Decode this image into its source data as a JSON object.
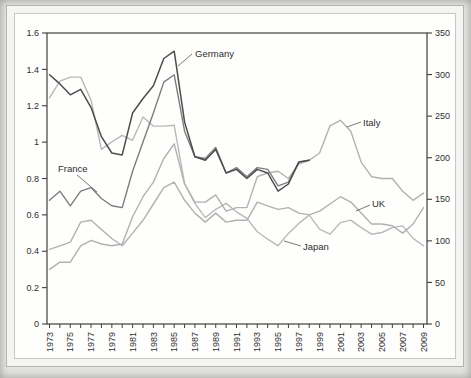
{
  "figure": {
    "page_background": "#e3e4e0",
    "frame_color": "#b4b5b1",
    "panel_background": "#fefefd",
    "axis_color": "#3f3f3f",
    "text_color": "#2e2e2e"
  },
  "chart_data": {
    "type": "line",
    "title": "",
    "xlabel": "",
    "ylabel_left": "",
    "ylabel_right": "",
    "grid": false,
    "legend_position": "none",
    "y_left": {
      "min": 0,
      "max": 1.6,
      "tick_labels": [
        "0",
        "0.2",
        "0.4",
        "0.6",
        "0.8",
        "1",
        "1.2",
        "1.4",
        "1.6"
      ]
    },
    "y_right": {
      "min": 0,
      "max": 350,
      "tick_labels": [
        "0",
        "50",
        "100",
        "150",
        "200",
        "250",
        "300",
        "350"
      ]
    },
    "x": [
      1973,
      1974,
      1975,
      1976,
      1977,
      1978,
      1979,
      1980,
      1981,
      1982,
      1983,
      1984,
      1985,
      1986,
      1987,
      1988,
      1989,
      1990,
      1991,
      1992,
      1993,
      1994,
      1995,
      1996,
      1997,
      1998,
      1999,
      2000,
      2001,
      2002,
      2003,
      2004,
      2005,
      2006,
      2007,
      2008,
      2009
    ],
    "x_tick_labels": [
      "1973",
      "1975",
      "1977",
      "1979",
      "1981",
      "1983",
      "1985",
      "1987",
      "1989",
      "1991",
      "1993",
      "1995",
      "1997",
      "1999",
      "2001",
      "2003",
      "2005",
      "2007",
      "2009"
    ],
    "series": [
      {
        "name": "Germany",
        "axis": "left",
        "color": "#4d4d4d",
        "width": 1.5,
        "values": [
          1.37,
          1.32,
          1.26,
          1.29,
          1.19,
          1.03,
          0.94,
          0.93,
          1.16,
          1.24,
          1.31,
          1.46,
          1.5,
          1.11,
          0.92,
          0.9,
          0.96,
          0.83,
          0.85,
          0.8,
          0.85,
          0.83,
          0.73,
          0.77,
          0.89,
          0.9,
          null,
          null,
          null,
          null,
          null,
          null,
          null,
          null,
          null,
          null,
          null
        ]
      },
      {
        "name": "France",
        "axis": "left",
        "color": "#7d7d7d",
        "width": 1.4,
        "values": [
          0.68,
          0.73,
          0.65,
          0.73,
          0.75,
          0.69,
          0.65,
          0.64,
          0.84,
          1.0,
          1.16,
          1.33,
          1.37,
          1.06,
          0.92,
          0.91,
          0.97,
          0.83,
          0.86,
          0.81,
          0.86,
          0.85,
          0.76,
          0.78,
          0.89,
          0.9,
          null,
          null,
          null,
          null,
          null,
          null,
          null,
          null,
          null,
          null,
          null
        ]
      },
      {
        "name": "Italy",
        "axis": "left",
        "color": "#b1b1b1",
        "width": 1.4,
        "values": [
          0.3,
          0.34,
          0.34,
          0.43,
          0.46,
          0.44,
          0.43,
          0.44,
          0.59,
          0.7,
          0.78,
          0.91,
          0.99,
          0.77,
          0.67,
          0.67,
          0.71,
          0.62,
          0.64,
          0.64,
          0.81,
          0.83,
          0.84,
          0.8,
          0.88,
          0.9,
          0.94,
          1.09,
          1.12,
          1.06,
          0.89,
          0.81,
          0.8,
          0.8,
          0.73,
          0.68,
          0.72
        ]
      },
      {
        "name": "UK",
        "axis": "left",
        "color": "#b1b1b1",
        "width": 1.4,
        "values": [
          0.41,
          0.43,
          0.45,
          0.56,
          0.57,
          0.52,
          0.47,
          0.43,
          0.5,
          0.57,
          0.66,
          0.75,
          0.78,
          0.68,
          0.61,
          0.56,
          0.61,
          0.56,
          0.57,
          0.57,
          0.67,
          0.65,
          0.63,
          0.64,
          0.61,
          0.6,
          0.62,
          0.66,
          0.7,
          0.67,
          0.61,
          0.55,
          0.55,
          0.54,
          0.5,
          0.55,
          0.64
        ]
      },
      {
        "name": "Japan",
        "axis": "right",
        "color": "#b9b9b9",
        "width": 1.4,
        "values": [
          272,
          292,
          297,
          297,
          269,
          210,
          219,
          227,
          221,
          249,
          238,
          238,
          239,
          169,
          145,
          128,
          138,
          145,
          135,
          127,
          111,
          102,
          94,
          109,
          121,
          131,
          114,
          108,
          122,
          125,
          116,
          108,
          110,
          116,
          118,
          103,
          94
        ]
      }
    ],
    "annotations": [
      {
        "text": "Germany",
        "x": 195,
        "y": 57,
        "ax1": 192,
        "ay1": 54,
        "ax2": 178,
        "ay2": 66
      },
      {
        "text": "France",
        "x": 58,
        "y": 172,
        "ax1": 77,
        "ay1": 175,
        "ax2": 97,
        "ay2": 192
      },
      {
        "text": "Italy",
        "x": 363,
        "y": 126,
        "ax1": 361,
        "ay1": 122,
        "ax2": 347,
        "ay2": 127
      },
      {
        "text": "UK",
        "x": 372,
        "y": 207,
        "ax1": 370,
        "ay1": 205,
        "ax2": 356,
        "ay2": 211
      },
      {
        "text": "Japan",
        "x": 303,
        "y": 250,
        "ax1": 301,
        "ay1": 246,
        "ax2": 284,
        "ay2": 241
      }
    ]
  }
}
